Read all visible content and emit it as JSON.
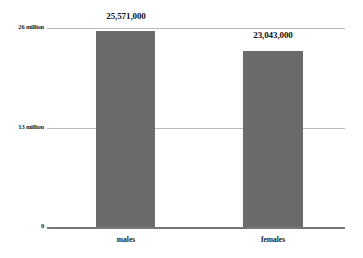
{
  "chart_data": {
    "type": "bar",
    "title": "",
    "xlabel": "",
    "ylabel": "",
    "categories": [
      "males",
      "females"
    ],
    "values": [
      25571000,
      23043000
    ],
    "value_labels": [
      "25,571,000",
      "23,043,000"
    ],
    "ytick_labels": [
      "0",
      "13 million",
      "26 million"
    ],
    "ytick_values": [
      0,
      13000000,
      26000000
    ],
    "ylim": [
      0,
      26000000
    ],
    "grid": true,
    "legend": "none",
    "bar_color": "#6b6b6b",
    "gridline_color": "#b9b9b9",
    "axis_color": "#777777",
    "background_color": "#ffffff"
  },
  "axis": {
    "y_top_label": "26 million",
    "y_mid_label": "13 million",
    "y_zero_label": "0"
  },
  "bars": [
    {
      "category": "males",
      "value_label": "25,571,000"
    },
    {
      "category": "females",
      "value_label": "23,043,000"
    }
  ]
}
